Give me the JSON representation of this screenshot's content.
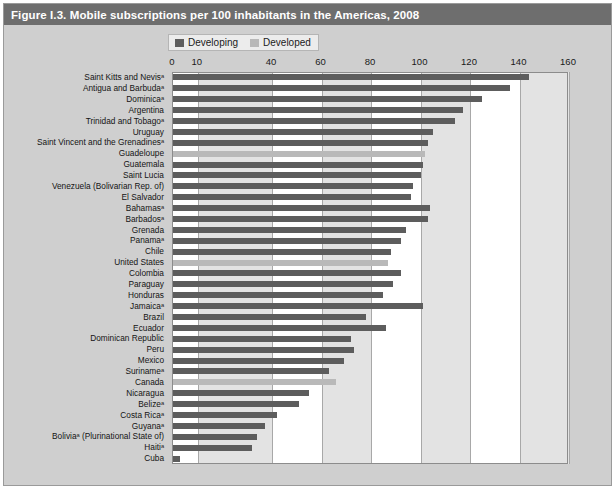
{
  "figure": {
    "title": "Figure I.3. Mobile subscriptions per 100 inhabitants in the Americas, 2008"
  },
  "legend": {
    "position": "top-center",
    "items": [
      {
        "label": "Developing",
        "color": "#5d5d5d",
        "icon": "square-swatch-icon"
      },
      {
        "label": "Developed",
        "color": "#b9b9b9",
        "icon": "square-swatch-icon"
      }
    ]
  },
  "colors": {
    "title_bar": "#6e6e6e",
    "panel": "#cfcfcf",
    "plot_bg": "#ffffff",
    "band": "#e3e3e3",
    "gridline": "#a8a8a8",
    "developing": "#5d5d5d",
    "developed": "#b9b9b9"
  },
  "chart_data": {
    "type": "bar",
    "orientation": "horizontal",
    "title": "Figure I.3. Mobile subscriptions per 100 inhabitants in the Americas, 2008",
    "xlabel": "",
    "ylabel": "",
    "xlim": [
      0,
      160
    ],
    "xticks": [
      0,
      10,
      40,
      60,
      80,
      100,
      120,
      140,
      160
    ],
    "xtick_labels": [
      "0",
      "10",
      "40",
      "60",
      "80",
      "100",
      "120",
      "140",
      "160"
    ],
    "grid": true,
    "legend": [
      "Developing",
      "Developed"
    ],
    "series": [
      {
        "name": "Developing",
        "color": "#5d5d5d"
      },
      {
        "name": "Developed",
        "color": "#b9b9b9"
      }
    ],
    "categories": [
      "Saint Kitts and Nevisᵃ",
      "Antigua and Barbudaᵃ",
      "Dominicaᵃ",
      "Argentina",
      "Trinidad and Tobagoᵃ",
      "Uruguay",
      "Saint Vincent and the Grenadinesᵃ",
      "Guadeloupe",
      "Guatemala",
      "Saint Lucia",
      "Venezuela (Bolivarian Rep. of)",
      "El Salvador",
      "Bahamasᵃ",
      "Barbadosᵃ",
      "Grenada",
      "Panamaᵃ",
      "Chile",
      "United States",
      "Colombia",
      "Paraguay",
      "Honduras",
      "Jamaicaᵃ",
      "Brazil",
      "Ecuador",
      "Dominican Republic",
      "Peru",
      "Mexico",
      "Surinameᵃ",
      "Canada",
      "Nicaragua",
      "Belizeᵃ",
      "Costa Ricaᵃ",
      "Guyanaᵃ",
      "Boliviaᵃ (Plurinational State of)",
      "Haitiᵃ",
      "Cuba"
    ],
    "values": [
      144.0,
      136.0,
      125.0,
      117.0,
      114.0,
      105.0,
      103.0,
      102.0,
      101.0,
      100.0,
      97.0,
      96.0,
      104.0,
      103.0,
      94.0,
      92.0,
      88.0,
      87.0,
      92.0,
      89.0,
      85.0,
      101.0,
      78.0,
      86.0,
      72.0,
      73.0,
      69.0,
      63.0,
      66.0,
      55.0,
      51.0,
      42.0,
      37.0,
      34.0,
      32.0,
      3.0
    ],
    "group": [
      "Developing",
      "Developing",
      "Developing",
      "Developing",
      "Developing",
      "Developing",
      "Developing",
      "Developed",
      "Developing",
      "Developing",
      "Developing",
      "Developing",
      "Developing",
      "Developing",
      "Developing",
      "Developing",
      "Developing",
      "Developed",
      "Developing",
      "Developing",
      "Developing",
      "Developing",
      "Developing",
      "Developing",
      "Developing",
      "Developing",
      "Developing",
      "Developing",
      "Developed",
      "Developing",
      "Developing",
      "Developing",
      "Developing",
      "Developing",
      "Developing",
      "Developing"
    ]
  }
}
